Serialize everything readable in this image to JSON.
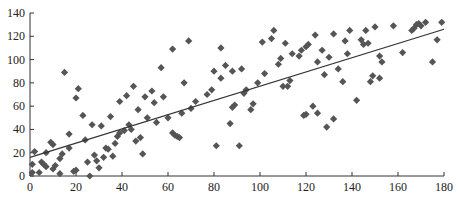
{
  "chart_data": {
    "type": "scatter",
    "title": "",
    "xlabel": "",
    "ylabel": "",
    "xlim": [
      0,
      180
    ],
    "ylim": [
      0,
      140
    ],
    "grid": false,
    "legend": null,
    "x_ticks": [
      0,
      20,
      40,
      60,
      80,
      100,
      120,
      140,
      160,
      180
    ],
    "y_ticks": [
      0,
      20,
      40,
      60,
      80,
      100,
      120,
      140
    ],
    "marker": "diamond",
    "marker_color": "#555555",
    "trendline": {
      "type": "linear",
      "x": [
        0,
        180
      ],
      "y": [
        16,
        126
      ]
    },
    "series": [
      {
        "name": "points",
        "points": [
          [
            1,
            3
          ],
          [
            1,
            10
          ],
          [
            2,
            21
          ],
          [
            4,
            3
          ],
          [
            5,
            12
          ],
          [
            6,
            10
          ],
          [
            7,
            8
          ],
          [
            7,
            20
          ],
          [
            9,
            29
          ],
          [
            10,
            27
          ],
          [
            10,
            6
          ],
          [
            11,
            9
          ],
          [
            13,
            2
          ],
          [
            13,
            15
          ],
          [
            14,
            19
          ],
          [
            15,
            89
          ],
          [
            17,
            36
          ],
          [
            17,
            24
          ],
          [
            19,
            4
          ],
          [
            20,
            67
          ],
          [
            20,
            5
          ],
          [
            21,
            75
          ],
          [
            23,
            52
          ],
          [
            24,
            31
          ],
          [
            25,
            12
          ],
          [
            26,
            0
          ],
          [
            27,
            44
          ],
          [
            28,
            18
          ],
          [
            29,
            13
          ],
          [
            30,
            7
          ],
          [
            31,
            43
          ],
          [
            32,
            16
          ],
          [
            33,
            24
          ],
          [
            34,
            23
          ],
          [
            35,
            51
          ],
          [
            36,
            17
          ],
          [
            37,
            28
          ],
          [
            38,
            34
          ],
          [
            39,
            37
          ],
          [
            39,
            64
          ],
          [
            41,
            39
          ],
          [
            42,
            69
          ],
          [
            43,
            44
          ],
          [
            44,
            40
          ],
          [
            45,
            77
          ],
          [
            46,
            30
          ],
          [
            47,
            57
          ],
          [
            48,
            33
          ],
          [
            49,
            19
          ],
          [
            50,
            68
          ],
          [
            51,
            50
          ],
          [
            53,
            73
          ],
          [
            54,
            63
          ],
          [
            55,
            46
          ],
          [
            57,
            93
          ],
          [
            58,
            68
          ],
          [
            60,
            50
          ],
          [
            62,
            37
          ],
          [
            62,
            109
          ],
          [
            63,
            35
          ],
          [
            64,
            34
          ],
          [
            65,
            33
          ],
          [
            66,
            54
          ],
          [
            67,
            80
          ],
          [
            69,
            116
          ],
          [
            70,
            58
          ],
          [
            72,
            64
          ],
          [
            77,
            70
          ],
          [
            79,
            74
          ],
          [
            80,
            90
          ],
          [
            81,
            26
          ],
          [
            83,
            110
          ],
          [
            83,
            84
          ],
          [
            85,
            95
          ],
          [
            87,
            45
          ],
          [
            88,
            90
          ],
          [
            88,
            59
          ],
          [
            89,
            61
          ],
          [
            91,
            26
          ],
          [
            92,
            92
          ],
          [
            93,
            71
          ],
          [
            94,
            74
          ],
          [
            96,
            57
          ],
          [
            97,
            62
          ],
          [
            99,
            80
          ],
          [
            101,
            115
          ],
          [
            102,
            88
          ],
          [
            105,
            118
          ],
          [
            106,
            125
          ],
          [
            108,
            96
          ],
          [
            109,
            101
          ],
          [
            110,
            77
          ],
          [
            111,
            114
          ],
          [
            112,
            77
          ],
          [
            113,
            82
          ],
          [
            114,
            105
          ],
          [
            117,
            103
          ],
          [
            118,
            108
          ],
          [
            119,
            52
          ],
          [
            120,
            111
          ],
          [
            120,
            53
          ],
          [
            121,
            113
          ],
          [
            123,
            60
          ],
          [
            124,
            121
          ],
          [
            125,
            98
          ],
          [
            125,
            54
          ],
          [
            127,
            108
          ],
          [
            128,
            87
          ],
          [
            129,
            42
          ],
          [
            130,
            102
          ],
          [
            132,
            49
          ],
          [
            132,
            122
          ],
          [
            134,
            92
          ],
          [
            136,
            81
          ],
          [
            137,
            116
          ],
          [
            138,
            105
          ],
          [
            139,
            125
          ],
          [
            142,
            65
          ],
          [
            144,
            117
          ],
          [
            145,
            113
          ],
          [
            146,
            125
          ],
          [
            147,
            114
          ],
          [
            148,
            81
          ],
          [
            149,
            86
          ],
          [
            150,
            128
          ],
          [
            152,
            84
          ],
          [
            152,
            103
          ],
          [
            153,
            98
          ],
          [
            158,
            129
          ],
          [
            162,
            106
          ],
          [
            166,
            125
          ],
          [
            167,
            127
          ],
          [
            168,
            130
          ],
          [
            169,
            131
          ],
          [
            170,
            129
          ],
          [
            172,
            132
          ],
          [
            175,
            98
          ],
          [
            177,
            117
          ],
          [
            179,
            132
          ]
        ]
      }
    ]
  }
}
